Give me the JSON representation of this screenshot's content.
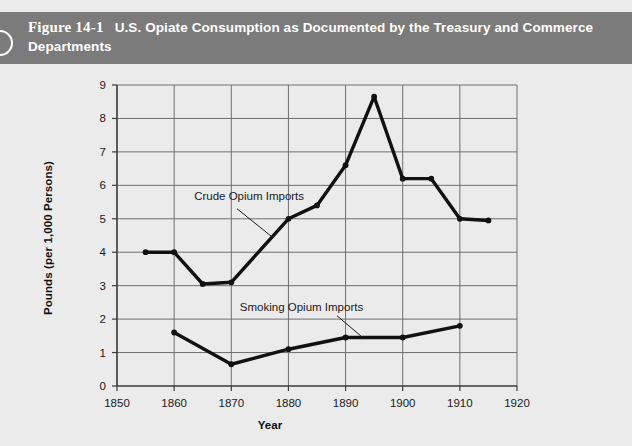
{
  "header": {
    "figure_number": "Figure 14-1",
    "title": "U.S. Opiate Consumption as Documented by the Treasury and Commerce Departments",
    "band_color": "#7b7b7b",
    "text_color": "#ffffff",
    "bullet_icon": "circle-outline-icon"
  },
  "page": {
    "background_color": "#ebebeb"
  },
  "chart_data": {
    "type": "line",
    "title": "U.S. Opiate Consumption as Documented by the Treasury and Commerce Departments",
    "xlabel": "Year",
    "ylabel": "Pounds (per 1,000 Persons)",
    "xlim": [
      1850,
      1920
    ],
    "ylim": [
      0,
      9
    ],
    "xticks": [
      1850,
      1860,
      1870,
      1880,
      1890,
      1900,
      1910,
      1920
    ],
    "xtick_labels": [
      "1850",
      "1860",
      "1870",
      "1880",
      "1890",
      "1900",
      "1910",
      "1920"
    ],
    "yticks": [
      0,
      1,
      2,
      3,
      4,
      5,
      6,
      7,
      8,
      9
    ],
    "ytick_labels": [
      "0",
      "1",
      "2",
      "3",
      "4",
      "5",
      "6",
      "7",
      "8",
      "9"
    ],
    "grid": "horizontal-and-vertical",
    "grid_color": "#6f6f6f",
    "legend_position": "inline-annotations",
    "line_color": "#111111",
    "series": [
      {
        "name": "Crude Opium Imports",
        "label_position": {
          "x": 1863.5,
          "y": 5.55
        },
        "leader_line": {
          "x1": 1871.0,
          "y1": 5.3,
          "x2": 1877.2,
          "y2": 4.45
        },
        "x": [
          1855,
          1860,
          1865,
          1870,
          1880,
          1885,
          1890,
          1895,
          1900,
          1905,
          1910,
          1915
        ],
        "values": [
          4.0,
          4.0,
          3.05,
          3.1,
          5.0,
          5.4,
          6.6,
          8.65,
          6.2,
          6.2,
          5.0,
          4.95
        ]
      },
      {
        "name": "Smoking Opium Imports",
        "label_position": {
          "x": 1871.5,
          "y": 2.25
        },
        "leader_line": {
          "x1": 1888.5,
          "y1": 2.1,
          "x2": 1893.2,
          "y2": 1.42
        },
        "x": [
          1860,
          1870,
          1880,
          1890,
          1900,
          1910
        ],
        "values": [
          1.6,
          0.65,
          1.1,
          1.45,
          1.45,
          1.8
        ]
      }
    ]
  }
}
